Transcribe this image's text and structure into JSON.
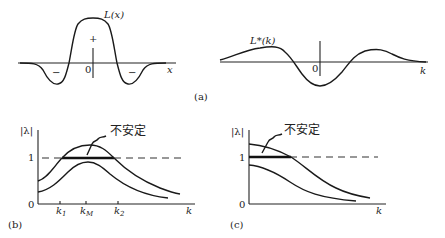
{
  "panel_a": {
    "caption": "(a)",
    "left": {
      "curve_label": "L(x)",
      "axis_label": "x",
      "origin": "0",
      "signs": [
        "−",
        "+",
        "−"
      ]
    },
    "right": {
      "curve_label": "L*(k)",
      "axis_label": "k",
      "origin": "0"
    }
  },
  "panel_b": {
    "caption": "(b)",
    "y_label": "|λ|",
    "y_tick_one": "1",
    "y_tick_zero": "0",
    "x_label": "k",
    "x_ticks": [
      "k₁",
      "k_M",
      "k₂"
    ],
    "x_tick_k1": "k",
    "x_tick_k1_sub": "1",
    "x_tick_kM": "k",
    "x_tick_kM_sub": "M",
    "x_tick_k2": "k",
    "x_tick_k2_sub": "2",
    "annotation": "不安定"
  },
  "panel_c": {
    "caption": "(c)",
    "y_label": "|λ|",
    "y_tick_one": "1",
    "y_tick_zero": "0",
    "x_label": "k",
    "annotation": "不安定"
  }
}
